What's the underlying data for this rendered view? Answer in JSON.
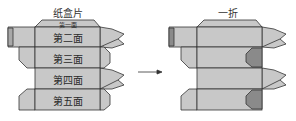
{
  "left_figure": {
    "caption": "纸盒片",
    "faces": [
      "第一面",
      "第二面",
      "第三面",
      "第四面",
      "第五面"
    ]
  },
  "right_figure": {
    "caption": "一折"
  },
  "arrow": "→",
  "colors": {
    "panel_fill": "#c8c8c8",
    "dark_fill": "#8a8a8a",
    "mid_fill": "#a8a8a8",
    "stroke": "#333333"
  }
}
